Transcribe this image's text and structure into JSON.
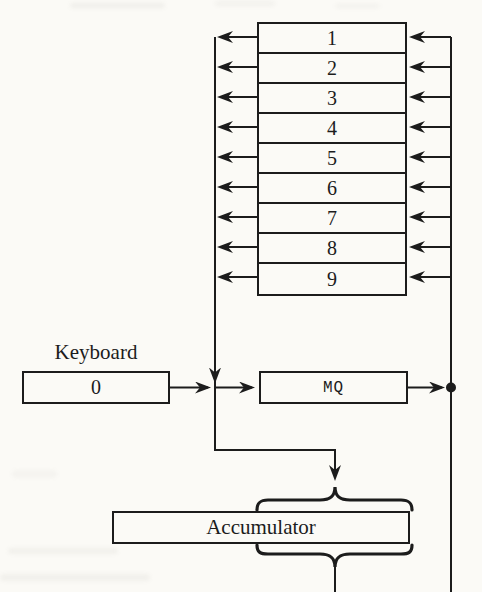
{
  "registers": {
    "rows": [
      "1",
      "2",
      "3",
      "4",
      "5",
      "6",
      "7",
      "8",
      "9"
    ]
  },
  "keyboard": {
    "title": "Keyboard",
    "value": "0"
  },
  "mq": {
    "label": "MQ"
  },
  "accumulator": {
    "label": "Accumulator"
  },
  "colors": {
    "line": "#1c1c1c",
    "paper": "#fbfaf6"
  }
}
